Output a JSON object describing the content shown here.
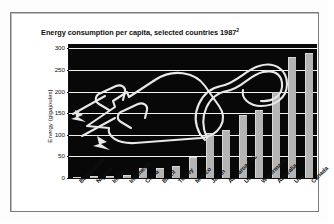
{
  "chart_data": {
    "type": "bar",
    "title": "Energy consumption per capita, selected countries 1987",
    "title_superscript": "2",
    "xlabel": "",
    "ylabel": "Energy (gigajoules)",
    "ylim": [
      0,
      310
    ],
    "yticks": [
      0,
      50,
      100,
      150,
      200,
      250,
      300
    ],
    "grid": true,
    "legend": "none",
    "categories": [
      "Bangladesh",
      "Nigeria",
      "India",
      "Indonesia",
      "China",
      "Brazil",
      "Turkey",
      "Mexico",
      "Japan",
      "Aotearoa / NZ",
      "UK",
      "W Germany",
      "Australia",
      "US",
      "Canada"
    ],
    "values": [
      2,
      4,
      5,
      6,
      24,
      23,
      27,
      48,
      105,
      110,
      146,
      158,
      198,
      280,
      290
    ],
    "annotation": "decorative electrical plug and cable line-art overlay",
    "colors": {
      "plot_background": "#080808",
      "bar_fill": "#b4b4b4",
      "bar_highlight": "#d8d8d8",
      "gridline": "#f2f2f2",
      "axis": "#111111",
      "page_background": "#ffffff",
      "frame": "#7a7a7a"
    }
  }
}
